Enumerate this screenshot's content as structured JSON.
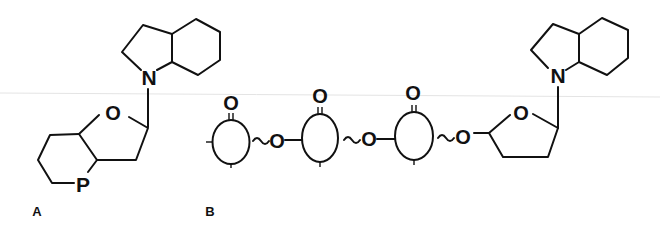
{
  "figure": {
    "panels": [
      {
        "label": "A",
        "description": "Hexahydroindole attached via N to a fused bicyclic furanose ring containing O and P",
        "atoms": {
          "indole_nitrogen": "N",
          "ring_oxygen": "O",
          "phosphorus": "P"
        }
      },
      {
        "label": "B",
        "description": "Chain of three oval subunits each bearing a carbonyl O, linked by ~O~ bridges, ending in a furanose ring attached via N to a hexahydroindole",
        "atoms": {
          "carbonyl_oxygens": [
            "O",
            "O",
            "O"
          ],
          "bridge_oxygens": [
            "O",
            "O",
            "O"
          ],
          "ring_oxygen": "O",
          "indole_nitrogen": "N"
        },
        "linker_glyph": "~"
      }
    ],
    "colors": {
      "ink": "#111111",
      "background": "#ffffff"
    }
  }
}
